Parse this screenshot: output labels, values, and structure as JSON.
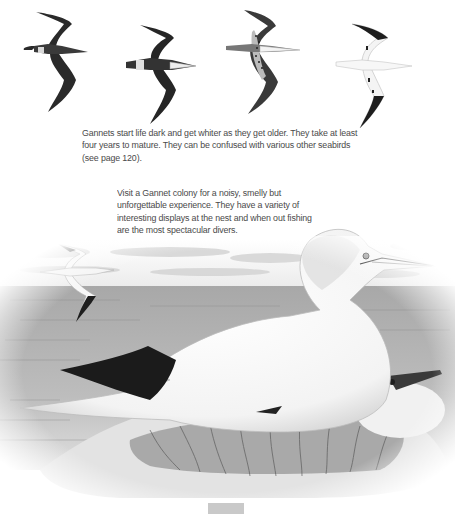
{
  "page": {
    "topic": "Gannet",
    "captions": {
      "plumage_caption": {
        "lines": [
          "Gannets start life dark and get whiter as they get older. They take at least",
          "four years to mature. They can be confused with various other seabirds",
          "(see page 120)."
        ]
      },
      "colony_caption": {
        "lines": [
          "Visit a Gannet colony for a noisy, smelly but",
          "unforgettable experience. They have a variety of",
          "interesting displays at the nest and when out fishing",
          "are the most spectacular divers."
        ]
      }
    },
    "illustrations": {
      "flight_sequence": [
        {
          "stage": "juvenile",
          "plumage": "dark"
        },
        {
          "stage": "immature-2",
          "plumage": "dark with white rump"
        },
        {
          "stage": "immature-3",
          "plumage": "speckled"
        },
        {
          "stage": "sub-adult",
          "plumage": "mostly white"
        }
      ],
      "scene": {
        "subject": "adult gannet on nest",
        "elements": [
          "sea",
          "clouds",
          "flying gannet",
          "second gannet on nest",
          "seaweed nest"
        ]
      }
    },
    "colors": {
      "text": "#4a4a4a",
      "ink": "#1e1e1e",
      "sea": "#9a9a9a",
      "page_tab": "#c9c9c9"
    }
  }
}
